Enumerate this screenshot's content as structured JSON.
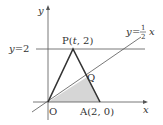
{
  "diagram": {
    "axes": {
      "x_label": "x",
      "y_label": "y",
      "origin_label": "O"
    },
    "line_y2": {
      "label": "y=2"
    },
    "line_half": {
      "label_prefix": "y=",
      "num": "1",
      "den": "2",
      "var": "x"
    },
    "points": {
      "P": {
        "label": "P(t, 2)"
      },
      "A": {
        "label": "A(2, 0)"
      },
      "Q": {
        "label": "Q"
      }
    },
    "colors": {
      "shade": "#cfcfcf",
      "stroke": "#333333"
    }
  }
}
